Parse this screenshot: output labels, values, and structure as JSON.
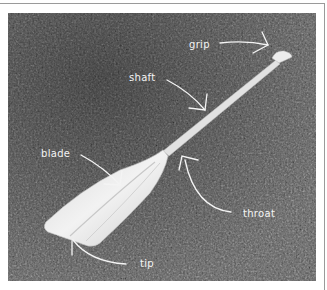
{
  "figure": {
    "colors": {
      "grass_dark": "#3f3f3f",
      "grass_mid": "#5e5e5e",
      "grass_light": "#7a7a7a",
      "paddle": "#e6e6e6",
      "annotation": "#f4f4f4",
      "frame": "#9a9a9a"
    },
    "labels": {
      "grip": "grip",
      "shaft": "shaft",
      "blade": "blade",
      "throat": "throat",
      "tip": "tip"
    }
  }
}
